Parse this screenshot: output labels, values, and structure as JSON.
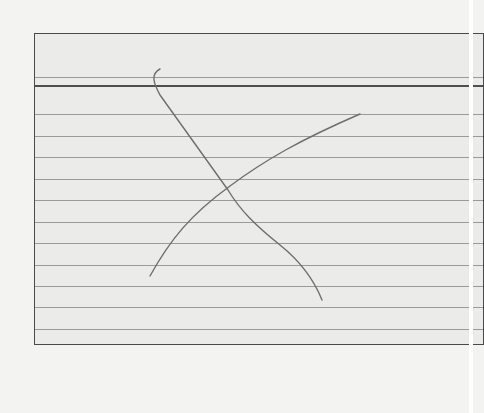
{
  "scene": {
    "description": "Photo of a ruled index card with a hand-drawn pencil X",
    "card": {
      "ruled_line_count": 11,
      "header_line": true,
      "colors": {
        "background": "#f3f3f2",
        "card": "#ebebea",
        "border": "#4a4a4a",
        "rule": "#9a9a9a",
        "pencil": "#6e6e6e"
      }
    },
    "drawing": {
      "mark": "X",
      "strokes": 2
    }
  }
}
